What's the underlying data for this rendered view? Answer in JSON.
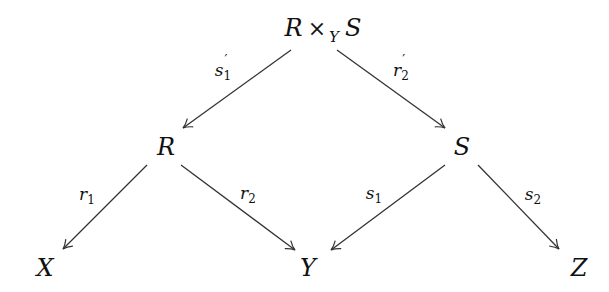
{
  "diagram": {
    "type": "commutative-diagram",
    "nodes": {
      "top": {
        "base1": "R",
        "op": "×",
        "subscript": "Y",
        "base2": "S",
        "x": 323,
        "y": 30
      },
      "R": {
        "text": "R",
        "x": 166,
        "y": 147
      },
      "S": {
        "text": "S",
        "x": 462,
        "y": 147
      },
      "X": {
        "text": "X",
        "x": 45,
        "y": 268
      },
      "Y": {
        "text": "Y",
        "x": 308,
        "y": 268
      },
      "Z": {
        "text": "Z",
        "x": 579,
        "y": 268
      }
    },
    "edges": [
      {
        "id": "s1prime",
        "from": "R ×_Y S",
        "to": "R",
        "label_base": "s",
        "label_sub": "1",
        "label_prime": "′",
        "x1": 291,
        "y1": 50,
        "x2": 183,
        "y2": 128,
        "lx": 223,
        "ly": 72
      },
      {
        "id": "r2prime",
        "from": "R ×_Y S",
        "to": "S",
        "label_base": "r",
        "label_sub": "2",
        "label_prime": "′",
        "x1": 337,
        "y1": 50,
        "x2": 445,
        "y2": 128,
        "lx": 401,
        "ly": 72
      },
      {
        "id": "r1",
        "from": "R",
        "to": "X",
        "label_base": "r",
        "label_sub": "1",
        "x1": 147,
        "y1": 165,
        "x2": 63,
        "y2": 249,
        "lx": 87,
        "ly": 196
      },
      {
        "id": "r2",
        "from": "R",
        "to": "Y",
        "label_base": "r",
        "label_sub": "2",
        "x1": 181,
        "y1": 165,
        "x2": 295,
        "y2": 250,
        "lx": 248,
        "ly": 195
      },
      {
        "id": "s1",
        "from": "S",
        "to": "Y",
        "label_base": "s",
        "label_sub": "1",
        "x1": 445,
        "y1": 165,
        "x2": 331,
        "y2": 250,
        "lx": 374,
        "ly": 195
      },
      {
        "id": "s2",
        "from": "S",
        "to": "Z",
        "label_base": "s",
        "label_sub": "2",
        "x1": 478,
        "y1": 165,
        "x2": 559,
        "y2": 249,
        "lx": 533,
        "ly": 196
      }
    ],
    "colors": {
      "stroke": "#333333",
      "text": "#111111",
      "background": "#ffffff"
    }
  }
}
